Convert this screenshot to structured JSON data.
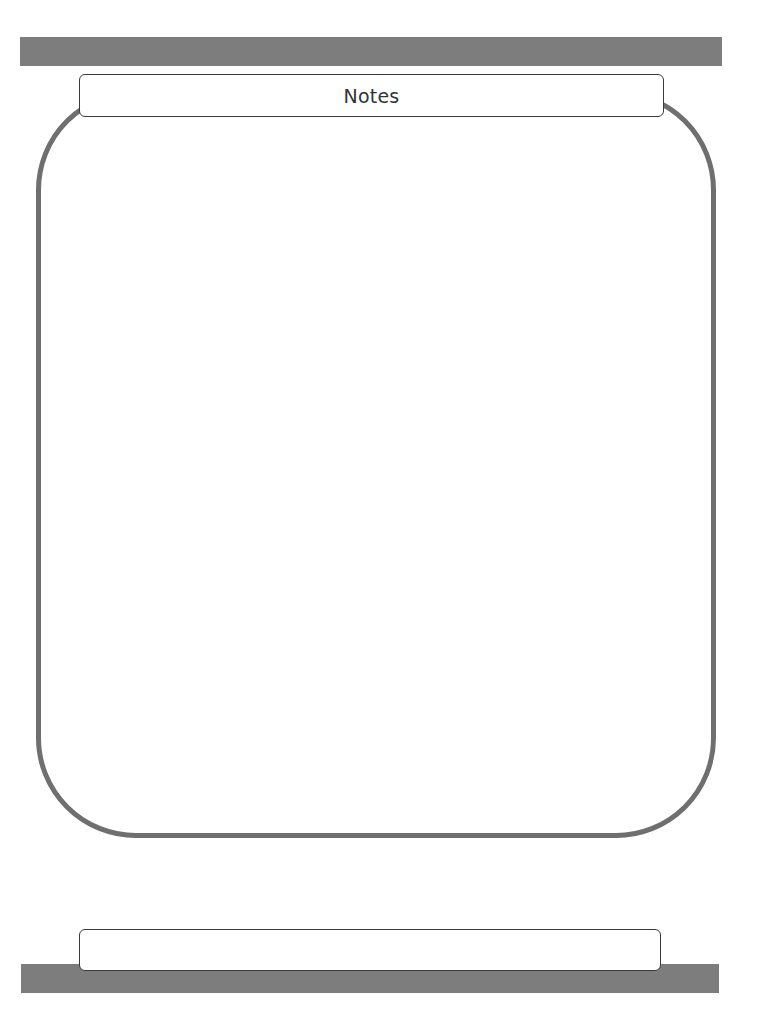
{
  "page": {
    "header": {
      "title": "Notes"
    },
    "notes_area": {
      "content": ""
    },
    "footer": {
      "text": ""
    },
    "colors": {
      "bar": "#7d7d7d",
      "frame": "#6f6f6f",
      "box_border": "#3a3a3a"
    }
  }
}
